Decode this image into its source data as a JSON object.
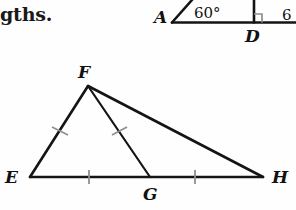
{
  "page": {
    "background_color": "#fefefe",
    "ink_color": "#141414",
    "tick_color": "#8e8e8e"
  },
  "text_fragment": {
    "label": "gths.",
    "note": "cut-off word at left edge of page"
  },
  "top_figure": {
    "name": "partial-angle-figure",
    "labels": {
      "a": "A",
      "d": "D"
    },
    "angles": {
      "at_a": "60°",
      "at_right_edge": "6"
    },
    "right_angle_marker": true
  },
  "triangle_figure": {
    "name": "triangle-EFH-with-cevian-FG",
    "labels": {
      "e": "E",
      "f": "F",
      "g": "G",
      "h": "H"
    },
    "segments": [
      {
        "name": "EF",
        "from": "E",
        "to": "F",
        "tick_marks": 1
      },
      {
        "name": "FG",
        "from": "F",
        "to": "G",
        "tick_marks": 1
      },
      {
        "name": "FH",
        "from": "F",
        "to": "H",
        "tick_marks": 0
      },
      {
        "name": "EG",
        "from": "E",
        "to": "G",
        "tick_marks": 1
      },
      {
        "name": "GH",
        "from": "G",
        "to": "H",
        "tick_marks": 1
      }
    ],
    "congruences": [
      "EF ≅ FG",
      "EG ≅ GH"
    ],
    "vertex_points": {
      "E": [
        30,
        177
      ],
      "F": [
        88,
        86
      ],
      "G": [
        150,
        177
      ],
      "H": [
        263,
        177
      ]
    }
  }
}
